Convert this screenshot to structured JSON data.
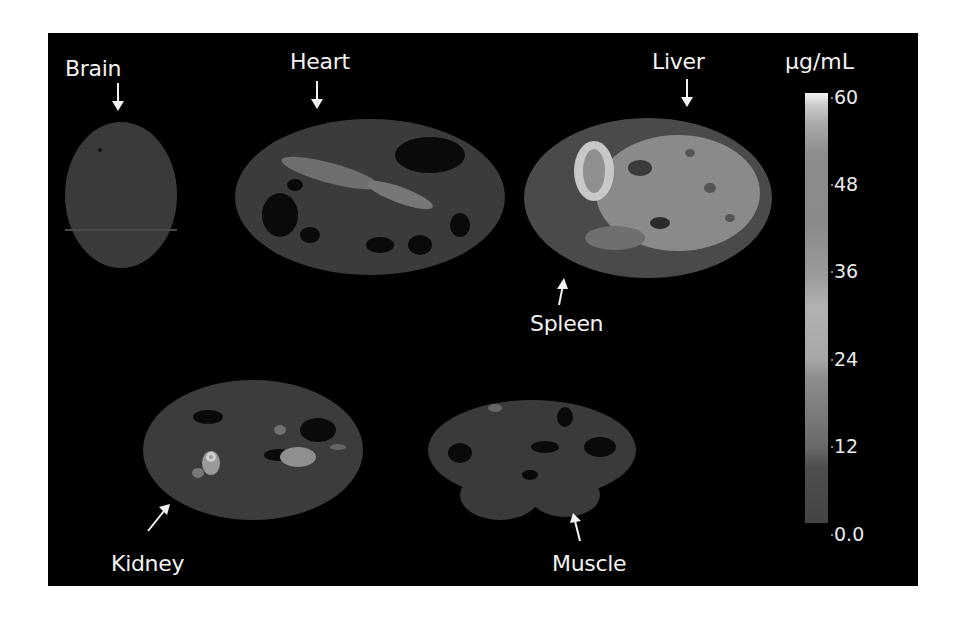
{
  "figure": {
    "type": "quantitative tissue-section imaging map (grayscale)",
    "background": "#000000",
    "organs": [
      {
        "id": "brain",
        "label": "Brain",
        "arrow": "down"
      },
      {
        "id": "heart",
        "label": "Heart",
        "arrow": "down"
      },
      {
        "id": "liver",
        "label": "Liver",
        "arrow": "down"
      },
      {
        "id": "spleen",
        "label": "Spleen",
        "arrow": "up"
      },
      {
        "id": "kidney",
        "label": "Kidney",
        "arrow": "up-right"
      },
      {
        "id": "muscle",
        "label": "Muscle",
        "arrow": "up"
      }
    ],
    "colorbar": {
      "unit": "µg/mL",
      "ticks": [
        "60",
        "48",
        "36",
        "24",
        "12",
        "0.0"
      ],
      "min": 0.0,
      "max": 60,
      "colors": {
        "top": "#f4f4f4",
        "mid": "#8a8a8a",
        "bottom": "#444444"
      }
    }
  }
}
